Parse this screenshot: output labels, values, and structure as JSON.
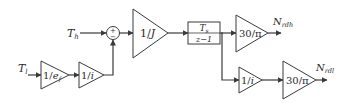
{
  "diagram": {
    "type": "block-diagram",
    "inputs": {
      "t_l": {
        "main": "T",
        "sub": "l"
      },
      "t_h": {
        "main": "T",
        "sub": "h"
      }
    },
    "blocks": {
      "gain_1_ef": {
        "prefix": "1/",
        "var": "e",
        "sub": "f"
      },
      "gain_1_i_upper": {
        "prefix": "1/",
        "var": "i"
      },
      "sum": {
        "sign_top": "+",
        "sign_bottom": "−"
      },
      "gain_1_J": {
        "prefix": "1/",
        "var": "J"
      },
      "integrator": {
        "num_main": "T",
        "num_sub": "s",
        "den": "z−1"
      },
      "gain_30_pi_top": {
        "label": "30/π"
      },
      "gain_1_i_lower": {
        "prefix": "1/",
        "var": "i"
      },
      "gain_30_pi_bottom": {
        "label": "30/π"
      }
    },
    "outputs": {
      "n_rdh": {
        "main": "N",
        "sub": "rdh"
      },
      "n_rdl": {
        "main": "N",
        "sub": "rdl"
      }
    },
    "colors": {
      "stroke": "#3a3a3a",
      "text": "#2a2a2a",
      "background": "#ffffff"
    }
  }
}
